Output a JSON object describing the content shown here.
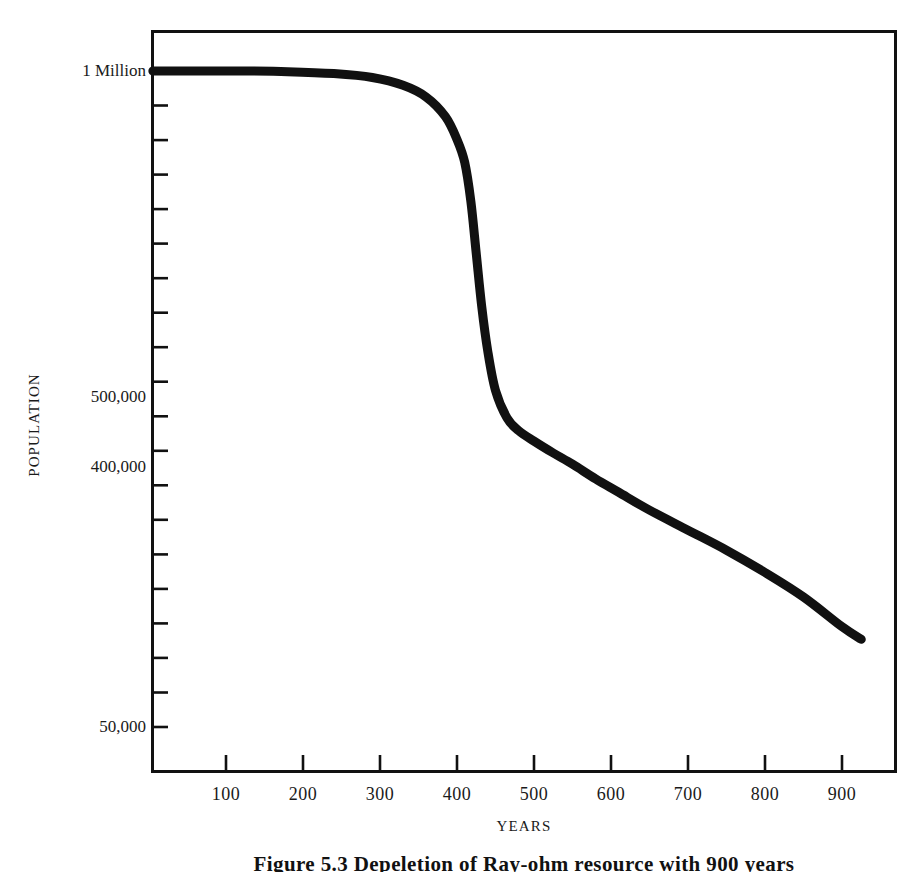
{
  "figure": {
    "caption": "Figure 5.3   Depeletion of Ray-ohm resource with 900 years"
  },
  "chart_data": {
    "type": "line",
    "title": "",
    "xlabel": "YEARS",
    "ylabel": "POPULATION",
    "xlim": [
      0,
      950
    ],
    "ylim": [
      0,
      1000000
    ],
    "grid": false,
    "legend": "none",
    "x_ticks": [
      100,
      200,
      300,
      400,
      500,
      600,
      700,
      800,
      900
    ],
    "x_tick_labels": [
      "100",
      "200",
      "300",
      "400",
      "500",
      "600",
      "700",
      "800",
      "900"
    ],
    "y_tick_labels": [
      {
        "value": 1000000,
        "label": "1 Million"
      },
      {
        "value": 500000,
        "label": "500,000"
      },
      {
        "value": 400000,
        "label": "400,000"
      },
      {
        "value": 50000,
        "label": "50,000"
      }
    ],
    "series": [
      {
        "name": "Population",
        "color": "#111111",
        "x": [
          5,
          60,
          120,
          180,
          240,
          290,
          330,
          360,
          385,
          400,
          410,
          418,
          425,
          432,
          440,
          450,
          465,
          480,
          500,
          525,
          550,
          580,
          610,
          650,
          700,
          750,
          800,
          850,
          900,
          925
        ],
        "y": [
          1000000,
          1000000,
          1000000,
          999000,
          996000,
          990000,
          978000,
          960000,
          930000,
          895000,
          860000,
          800000,
          720000,
          640000,
          570000,
          510000,
          470000,
          452000,
          437000,
          420000,
          404000,
          384000,
          366000,
          342000,
          315000,
          288000,
          258000,
          225000,
          185000,
          168000
        ]
      }
    ]
  },
  "axes": {
    "y_tick_count": 20,
    "x_tick_count": 9
  }
}
